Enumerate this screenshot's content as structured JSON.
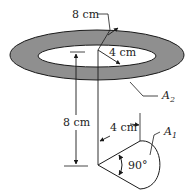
{
  "diagram": {
    "labels": {
      "outer_radius": "8 cm",
      "inner_radius": "4 cm",
      "height": "8 cm",
      "cone_radius": "4 cm",
      "angle": "90°",
      "area_ring": "A",
      "area_ring_sub": "2",
      "area_cone": "A",
      "area_cone_sub": "1"
    },
    "colors": {
      "ring_fill": "#8f8f8f",
      "line": "#1a1a1a",
      "background": "#ffffff"
    }
  }
}
